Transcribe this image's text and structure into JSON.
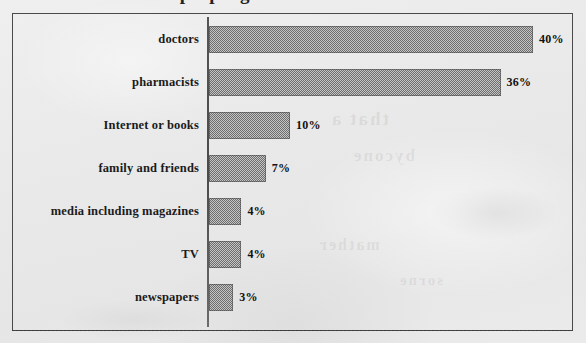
{
  "figure": {
    "title_cropped": "Where people get information about medicines",
    "frame_visible": true
  },
  "chart_data": {
    "type": "bar",
    "orientation": "horizontal",
    "title": "",
    "xlabel": "",
    "ylabel": "",
    "grid": false,
    "legend": null,
    "xlim": [
      0,
      42
    ],
    "categories": [
      "doctors",
      "pharmacists",
      "Internet or books",
      "family and friends",
      "media including magazines",
      "TV",
      "newspapers"
    ],
    "values": [
      40,
      36,
      10,
      7,
      4,
      4,
      3
    ],
    "value_labels": [
      "40%",
      "36%",
      "10%",
      "7%",
      "4%",
      "4%",
      "3%"
    ],
    "units": "percent",
    "bar_color": "#8f8f8f",
    "bar_edge_color": "#4a4a4a",
    "axis_color": "#4a4a4a",
    "background_color": "#ececec"
  },
  "bleed_through": {
    "line1": "that a",
    "line2": "bycone",
    "line3": "mather",
    "line4": "sorne"
  }
}
